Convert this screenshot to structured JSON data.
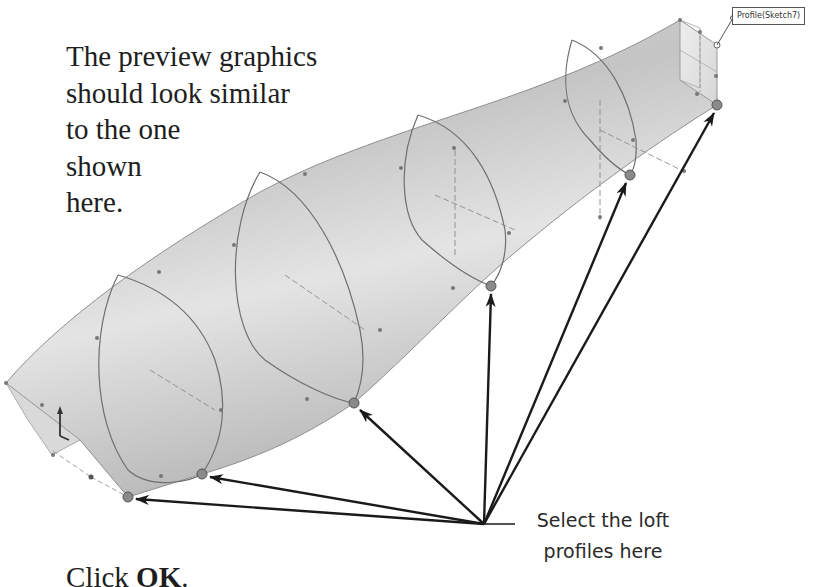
{
  "instruction": {
    "lines": [
      "The preview graphics",
      "should look similar",
      "to the one",
      "shown",
      "here."
    ]
  },
  "callout": {
    "line1": "Select the loft",
    "line2": "profiles here"
  },
  "step": {
    "prefix": "Click ",
    "emphasis": "OK",
    "suffix": "."
  },
  "model": {
    "profile_tag": "Profile(Sketch7)",
    "selection_points": [
      {
        "name": "profile-1",
        "x": 128,
        "y": 497
      },
      {
        "name": "profile-2",
        "x": 202,
        "y": 474
      },
      {
        "name": "profile-3",
        "x": 354,
        "y": 403
      },
      {
        "name": "profile-4",
        "x": 491,
        "y": 286
      },
      {
        "name": "profile-5",
        "x": 630,
        "y": 175
      },
      {
        "name": "profile-6",
        "x": 717,
        "y": 105
      }
    ],
    "arrow_origin": {
      "x": 484,
      "y": 524
    },
    "colors": {
      "surface_light": "#e8e8e8",
      "surface_mid": "#c9c9c9",
      "surface_dark": "#a9a9a9",
      "edge": "#6f6f6f",
      "arrow": "#1a1a1a",
      "point": "#8a8a8a"
    }
  }
}
